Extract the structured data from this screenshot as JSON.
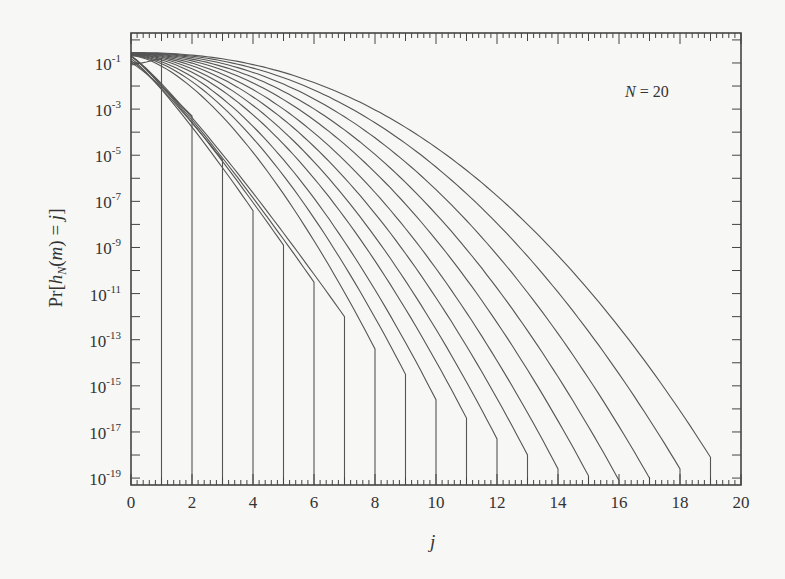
{
  "chart_data": {
    "type": "line",
    "title": "",
    "annotation": "N = 20",
    "xlabel": "j",
    "ylabel": "Pr[h_N(m) = j]",
    "xlim": [
      0,
      20
    ],
    "ylim_log10": [
      -19.3,
      0.3
    ],
    "yscale": "log",
    "grid": false,
    "legend": "none",
    "x_ticks": [
      0,
      2,
      4,
      6,
      8,
      10,
      12,
      14,
      16,
      18,
      20
    ],
    "y_ticks": [
      "10^-1",
      "10^-3",
      "10^-5",
      "10^-7",
      "10^-9",
      "10^-11",
      "10^-13",
      "10^-15",
      "10^-17",
      "10^-19"
    ],
    "y_tick_exponents": [
      -1,
      -3,
      -5,
      -7,
      -9,
      -11,
      -13,
      -15,
      -17,
      -19
    ],
    "series_description": "One curve per m = 1..19; each curve spans j = 0..m and then drops vertically to the bottom axis at j = m",
    "series": [
      {
        "name": "m=1",
        "end_j": 1,
        "end_log10": -0.8
      },
      {
        "name": "m=2",
        "end_j": 2,
        "end_log10": -3.3
      },
      {
        "name": "m=3",
        "end_j": 3,
        "end_log10": -5.2
      },
      {
        "name": "m=4",
        "end_j": 4,
        "end_log10": -7.4
      },
      {
        "name": "m=5",
        "end_j": 5,
        "end_log10": -8.9
      },
      {
        "name": "m=6",
        "end_j": 6,
        "end_log10": -10.5
      },
      {
        "name": "m=7",
        "end_j": 7,
        "end_log10": -12.0
      },
      {
        "name": "m=8",
        "end_j": 8,
        "end_log10": -13.4
      },
      {
        "name": "m=9",
        "end_j": 9,
        "end_log10": -14.5
      },
      {
        "name": "m=10",
        "end_j": 10,
        "end_log10": -15.6
      },
      {
        "name": "m=11",
        "end_j": 11,
        "end_log10": -16.4
      },
      {
        "name": "m=12",
        "end_j": 12,
        "end_log10": -17.3
      },
      {
        "name": "m=13",
        "end_j": 13,
        "end_log10": -18.0
      },
      {
        "name": "m=14",
        "end_j": 14,
        "end_log10": -18.6
      },
      {
        "name": "m=15",
        "end_j": 15,
        "end_log10": -18.9
      },
      {
        "name": "m=16",
        "end_j": 16,
        "end_log10": -19.1
      },
      {
        "name": "m=17",
        "end_j": 17,
        "end_log10": -19.0
      },
      {
        "name": "m=18",
        "end_j": 18,
        "end_log10": -18.6
      },
      {
        "name": "m=19",
        "end_j": 19,
        "end_log10": -18.1
      }
    ]
  },
  "labels": {
    "annotation_n": "N",
    "annotation_rest": " = 20",
    "xlabel": "j",
    "ylabel": "Pr[h_N(m) = j]"
  },
  "colors": {
    "line": "#555555",
    "axis": "#444444",
    "background": "#f7f7f5"
  }
}
